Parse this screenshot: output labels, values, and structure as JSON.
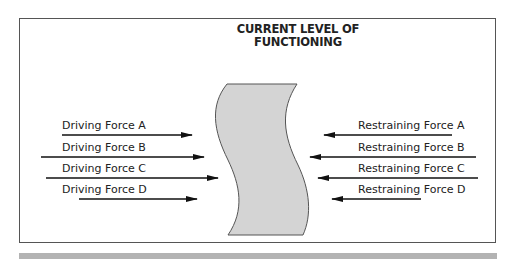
{
  "title_line1": "CURRENT LEVEL OF",
  "title_line2": "FUNCTIONING",
  "driving_forces": [
    {
      "label": "Driving Force A"
    },
    {
      "label": "Driving Force B"
    },
    {
      "label": "Driving Force C"
    },
    {
      "label": "Driving Force D"
    }
  ],
  "restraining_forces": [
    {
      "label": "Restraining Force A"
    },
    {
      "label": "Restraining Force B"
    },
    {
      "label": "Restraining Force C"
    },
    {
      "label": "Restraining Force D"
    }
  ],
  "colors": {
    "shape_fill": "#d4d4d4",
    "shape_stroke": "#555555",
    "arrow": "#111111",
    "frame": "#555555",
    "bar": "#b3b3b3"
  }
}
